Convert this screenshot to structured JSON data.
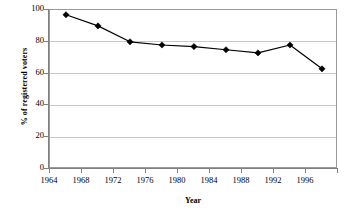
{
  "chart_data": {
    "type": "line",
    "title": "",
    "xlabel": "Year",
    "ylabel": "% of registered voters",
    "categories": [
      "1964",
      "1968",
      "1972",
      "1976",
      "1980",
      "1984",
      "1988",
      "1992",
      "1996"
    ],
    "values": [
      97,
      90,
      80,
      78,
      77,
      75,
      73,
      78,
      63
    ],
    "series": [
      {
        "name": "% of registered voters",
        "values": [
          97,
          90,
          80,
          78,
          77,
          75,
          73,
          78,
          63
        ]
      }
    ],
    "ylim": [
      0,
      100
    ],
    "y_ticks": [
      "100",
      "80",
      "60",
      "40",
      "20",
      "0"
    ],
    "y_tick_values": [
      100,
      80,
      60,
      40,
      20,
      0
    ],
    "grid": true,
    "legend": "none",
    "marker": "diamond",
    "marker_color": "#000000",
    "line_color": "#000000",
    "gridline_color": "#c8c8c8",
    "frame_color": "#9a9a9a",
    "background_color": "#ffffff"
  }
}
